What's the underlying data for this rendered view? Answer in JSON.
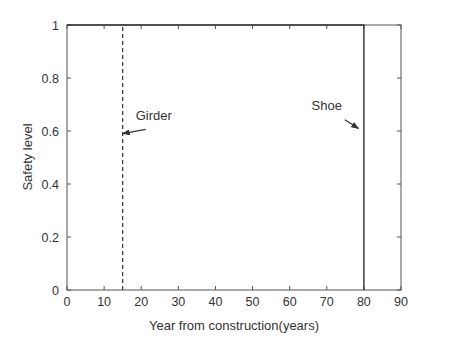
{
  "chart_data": {
    "type": "line",
    "title": "",
    "xlabel": "Year from construction(years)",
    "ylabel": "Safety level",
    "xlim": [
      0,
      90
    ],
    "ylim": [
      0,
      1
    ],
    "xticks": [
      0,
      10,
      20,
      30,
      40,
      50,
      60,
      70,
      80,
      90
    ],
    "yticks": [
      0,
      0.2,
      0.4,
      0.6,
      0.8,
      1
    ],
    "ytick_labels": [
      "0",
      "0.2",
      "0.4",
      "0.6",
      "0.8",
      "1"
    ],
    "grid": false,
    "legend": null,
    "series": [
      {
        "name": "Girder",
        "style": "dashed",
        "x": [
          15,
          15
        ],
        "y": [
          0,
          1
        ]
      },
      {
        "name": "Shoe",
        "style": "solid",
        "x": [
          0,
          80,
          80
        ],
        "y": [
          1,
          1,
          0
        ]
      }
    ],
    "annotations": [
      {
        "text": "Girder",
        "text_pos": [
          18.5,
          0.64
        ],
        "arrow_to": [
          15,
          0.59
        ]
      },
      {
        "text": "Shoe",
        "text_pos": [
          70,
          0.68
        ],
        "arrow_to": [
          78.5,
          0.61
        ]
      }
    ]
  }
}
